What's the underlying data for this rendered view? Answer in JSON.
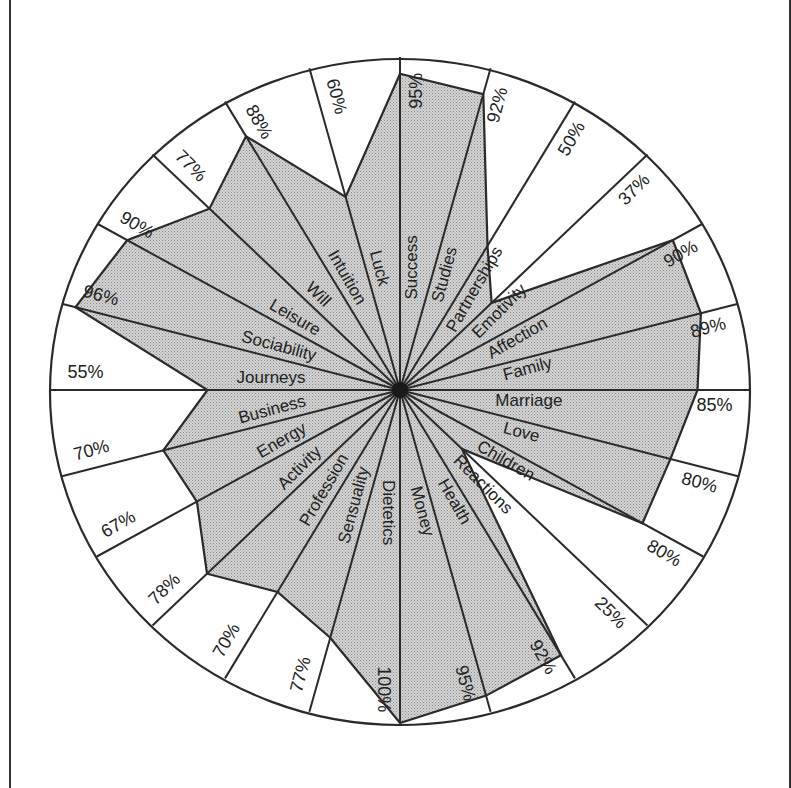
{
  "chart_data": {
    "type": "radar",
    "title": "",
    "value_unit": "%",
    "range": [
      0,
      100
    ],
    "grid": false,
    "fill": "stippled gray",
    "axes_order": "clockwise from top",
    "categories": [
      "Success",
      "Studies",
      "Partnerships",
      "Emotivity",
      "Affection",
      "Family",
      "Marriage",
      "Love",
      "Children",
      "Reactions",
      "Health",
      "Money",
      "Dietetics",
      "Sensuality",
      "Profession",
      "Activity",
      "Energy",
      "Business",
      "Journeys",
      "Sociability",
      "Leisure",
      "Will",
      "Intuition",
      "Luck"
    ],
    "values": [
      95,
      92,
      50,
      37,
      90,
      89,
      85,
      80,
      80,
      25,
      92,
      95,
      100,
      77,
      70,
      78,
      67,
      70,
      55,
      96,
      90,
      77,
      88,
      60
    ],
    "value_labels": [
      "95%",
      "92%",
      "50%",
      "37%",
      "90%",
      "89%",
      "85%",
      "80%",
      "80%",
      "25%",
      "92%",
      "95%",
      "100%",
      "77%",
      "70%",
      "78%",
      "67%",
      "70%",
      "55%",
      "96%",
      "90%",
      "77%",
      "88%",
      "60%"
    ]
  },
  "colors": {
    "line": "#2a2a2a",
    "fill": "#c9c9c9",
    "background": "#ffffff"
  }
}
